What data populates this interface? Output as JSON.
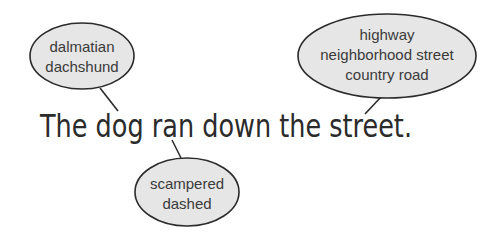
{
  "sentence": "The dog ran down the street.",
  "bubbles": [
    {
      "id": "dog-synonyms",
      "target_word": "dog",
      "lines": [
        "dalmatian",
        "dachshund"
      ]
    },
    {
      "id": "street-synonyms",
      "target_word": "street",
      "lines": [
        "highway",
        "neighborhood street",
        "country road"
      ]
    },
    {
      "id": "ran-synonyms",
      "target_word": "ran",
      "lines": [
        "scampered",
        "dashed"
      ]
    }
  ],
  "colors": {
    "bubble_fill": "#e6e6e6",
    "stroke": "#2b2b2b",
    "text": "#3a3a3a"
  }
}
